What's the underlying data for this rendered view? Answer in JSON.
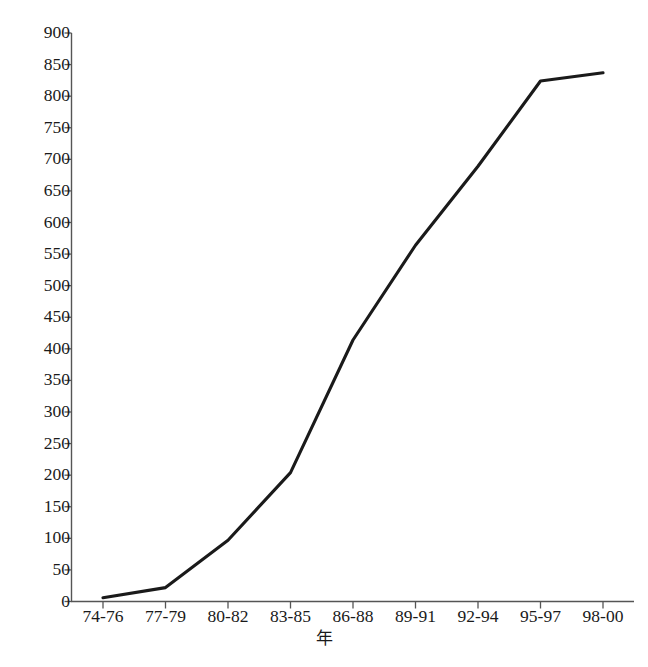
{
  "chart_data": {
    "type": "line",
    "title": "",
    "xlabel": "年",
    "ylabel": "",
    "categories": [
      "74-76",
      "77-79",
      "80-82",
      "83-85",
      "86-88",
      "89-91",
      "92-94",
      "95-97",
      "98-00"
    ],
    "values": [
      6,
      22,
      97,
      204,
      414,
      564,
      689,
      824,
      837
    ],
    "ylim": [
      0,
      900
    ],
    "ytick_values": [
      0,
      50,
      100,
      150,
      200,
      250,
      300,
      350,
      400,
      450,
      500,
      550,
      600,
      650,
      700,
      750,
      800,
      850,
      900
    ],
    "ytick_labels": [
      "0",
      "50",
      "100",
      "150",
      "200",
      "250",
      "300",
      "350",
      "400",
      "450",
      "500",
      "550",
      "600",
      "650",
      "700",
      "750",
      "800",
      "850",
      "900"
    ],
    "grid": false,
    "legend": null,
    "series": [
      {
        "name": "",
        "values": [
          6,
          22,
          97,
          204,
          414,
          564,
          689,
          824,
          837
        ],
        "color": "#1a1a1a"
      }
    ],
    "line_color": "#1a1a1a",
    "axis_color": "#555555",
    "background_color": "#ffffff"
  },
  "axes": {
    "x_title": "年"
  }
}
